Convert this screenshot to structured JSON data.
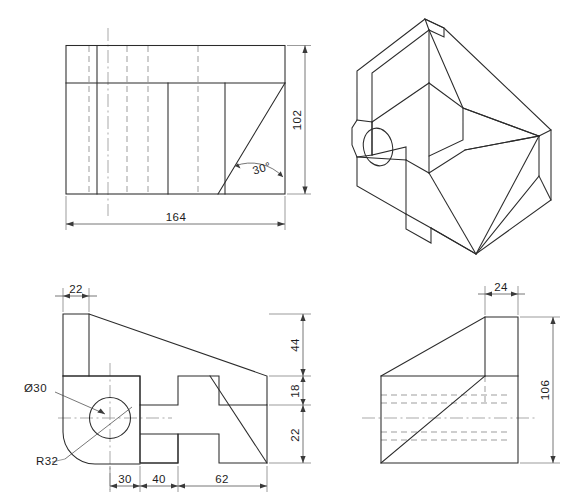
{
  "drawing": {
    "title": "Orthographic and isometric views of a bracket",
    "units": "mm",
    "line_colors": {
      "visible_edge": "#2b2b2b",
      "hidden_edge": "#8d8d8d",
      "center_line": "#9a9a9a",
      "dimension": "#4a4a4a",
      "text": "#1d1d1d",
      "background": "#ffffff"
    }
  },
  "views": {
    "top_view": {
      "name": "Top view",
      "dimensions": [
        {
          "id": "width-164",
          "label": "164",
          "orientation": "horizontal"
        },
        {
          "id": "height-102",
          "label": "102",
          "orientation": "vertical"
        },
        {
          "id": "angle-30",
          "label": "30°",
          "orientation": "angular"
        }
      ]
    },
    "iso_view": {
      "name": "Isometric view",
      "dimensions": []
    },
    "front_view": {
      "name": "Front view",
      "dimensions": [
        {
          "id": "width-22",
          "label": "22",
          "orientation": "horizontal"
        },
        {
          "id": "height-44",
          "label": "44",
          "orientation": "vertical"
        },
        {
          "id": "height-18",
          "label": "18",
          "orientation": "vertical"
        },
        {
          "id": "height-22",
          "label": "22",
          "orientation": "vertical"
        },
        {
          "id": "width-30",
          "label": "30",
          "orientation": "horizontal"
        },
        {
          "id": "width-40",
          "label": "40",
          "orientation": "horizontal"
        },
        {
          "id": "width-62",
          "label": "62",
          "orientation": "horizontal"
        }
      ],
      "annotations": [
        {
          "id": "hole-diameter",
          "label": "Ø30"
        },
        {
          "id": "fillet-radius",
          "label": "R32"
        }
      ]
    },
    "side_view": {
      "name": "Side view",
      "dimensions": [
        {
          "id": "width-24",
          "label": "24",
          "orientation": "horizontal"
        },
        {
          "id": "height-106",
          "label": "106",
          "orientation": "vertical"
        }
      ]
    }
  },
  "labels": {
    "d164": "164",
    "d102": "102",
    "a30": "30°",
    "d22_top": "22",
    "d44": "44",
    "d18": "18",
    "d22_bottom": "22",
    "d30": "30",
    "d40": "40",
    "d62": "62",
    "dia30": "Ø30",
    "r32": "R32",
    "d24": "24",
    "d106": "106"
  }
}
